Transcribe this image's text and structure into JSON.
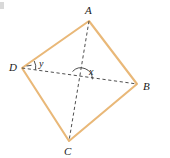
{
  "figure": {
    "type": "geometry-diagram",
    "colors": {
      "edge": "#E9B878",
      "diagonal": "#3a3a3a",
      "label": "#1a1a1a",
      "credit": "#8a8a8a",
      "background": "#ffffff"
    },
    "vertices": [
      {
        "name": "A",
        "label": "A",
        "x": 89,
        "y": 21
      },
      {
        "name": "B",
        "label": "B",
        "x": 137,
        "y": 84
      },
      {
        "name": "C",
        "label": "C",
        "x": 69,
        "y": 141
      },
      {
        "name": "D",
        "label": "D",
        "x": 22,
        "y": 68
      }
    ],
    "edges": [
      {
        "from": "A",
        "to": "B"
      },
      {
        "from": "B",
        "to": "C"
      },
      {
        "from": "C",
        "to": "D"
      },
      {
        "from": "D",
        "to": "A"
      }
    ],
    "diagonals": [
      {
        "from": "A",
        "to": "C",
        "style": "dashed"
      },
      {
        "from": "D",
        "to": "B",
        "style": "dashed"
      }
    ],
    "intersection": {
      "x": 81,
      "y": 80
    },
    "angles": [
      {
        "label": "x",
        "at": "intersection",
        "mark": "arc"
      },
      {
        "label": "y",
        "at": "D",
        "mark": "arc"
      }
    ]
  },
  "credit": {
    "text": "Banco de imagens/Arquivo da editora"
  }
}
